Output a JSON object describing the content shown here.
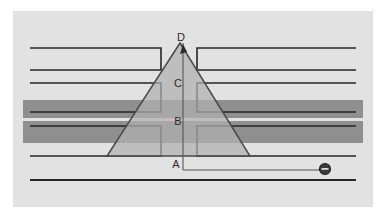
{
  "figure": {
    "panel": {
      "background_color": "#e2e2e2",
      "outer_background_color": "#ffffff",
      "x": 13,
      "y": 11,
      "width": 360,
      "height": 196
    },
    "line_color": "#262626",
    "band_color": "#8f8f8f",
    "triangle_fill": "#b0b0b0",
    "triangle_stroke": "#4a4a4a",
    "labels": [
      {
        "id": "label-d",
        "text": "D",
        "x": 181,
        "y": 41,
        "role": "apex-vertex"
      },
      {
        "id": "label-c",
        "text": "C",
        "x": 178,
        "y": 87,
        "role": "upper-zone"
      },
      {
        "id": "label-b",
        "text": "B",
        "x": 178,
        "y": 125,
        "role": "middle-zone"
      },
      {
        "id": "label-a",
        "text": "A",
        "x": 176,
        "y": 168,
        "role": "base-vertex"
      }
    ],
    "horizontal_lines": [
      {
        "id": "line-1-left",
        "x1": 30,
        "y": 48,
        "x2": 161
      },
      {
        "id": "line-1-right",
        "x1": 197,
        "y": 48,
        "x2": 356
      },
      {
        "id": "line-2-left",
        "x1": 30,
        "y": 70,
        "x2": 161
      },
      {
        "id": "line-2-right",
        "x1": 197,
        "y": 70,
        "x2": 356
      },
      {
        "id": "line-3-left",
        "x1": 30,
        "y": 83,
        "x2": 161
      },
      {
        "id": "line-3-right",
        "x1": 197,
        "y": 83,
        "x2": 356
      },
      {
        "id": "line-4-left",
        "x1": 30,
        "y": 112,
        "x2": 161
      },
      {
        "id": "line-4-right",
        "x1": 197,
        "y": 112,
        "x2": 356
      },
      {
        "id": "line-5-left",
        "x1": 30,
        "y": 126,
        "x2": 161
      },
      {
        "id": "line-5-right",
        "x1": 197,
        "y": 126,
        "x2": 356
      },
      {
        "id": "line-6-left",
        "x1": 30,
        "y": 156,
        "x2": 161
      },
      {
        "id": "line-6-right",
        "x1": 197,
        "y": 156,
        "x2": 356
      },
      {
        "id": "line-7-full",
        "x1": 30,
        "y": 180,
        "x2": 356
      }
    ],
    "shaded_bands": [
      {
        "id": "band-upper",
        "x": 23,
        "y": 100,
        "width": 340,
        "height": 18
      },
      {
        "id": "band-lower",
        "x": 23,
        "y": 121,
        "width": 340,
        "height": 22
      }
    ],
    "brackets": [
      {
        "id": "bracket-top-left",
        "x": 30,
        "y": 48,
        "width": 131,
        "height": 22
      },
      {
        "id": "bracket-top-right",
        "x": 197,
        "y": 48,
        "width": 159,
        "height": 22
      },
      {
        "id": "bracket-mid-left",
        "x": 30,
        "y": 83,
        "width": 131,
        "height": 29
      },
      {
        "id": "bracket-mid-right",
        "x": 197,
        "y": 83,
        "width": 159,
        "height": 29
      },
      {
        "id": "bracket-low-left",
        "x": 30,
        "y": 126,
        "width": 131,
        "height": 30
      },
      {
        "id": "bracket-low-right",
        "x": 197,
        "y": 126,
        "width": 159,
        "height": 30
      }
    ],
    "triangle": {
      "id": "central-triangle",
      "apex": {
        "x": 180,
        "y": 43
      },
      "base_left": {
        "x": 107,
        "y": 156
      },
      "base_right": {
        "x": 250,
        "y": 156
      }
    },
    "axis": {
      "id": "vertical-axis",
      "x": 183,
      "y_top": 43,
      "y_bottom": 170,
      "arrow_head": {
        "x": 186,
        "y": 49,
        "direction": "up"
      }
    },
    "connector": {
      "id": "bottom-connector",
      "x1": 183,
      "y1": 170,
      "x2": 325,
      "y2": 170
    },
    "marker": {
      "id": "circle-marker",
      "symbol": "theta-circle",
      "cx": 325,
      "cy": 169,
      "r": 5.5,
      "fill": "#3a3a3a"
    }
  }
}
